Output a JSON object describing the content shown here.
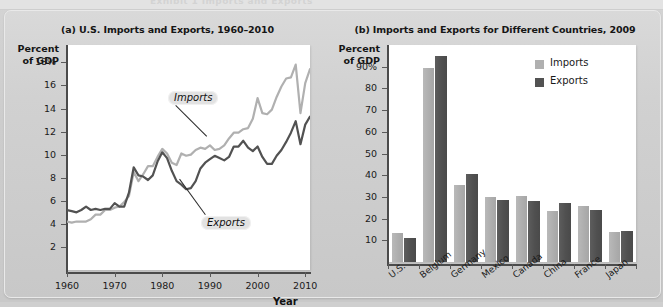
{
  "figure": {
    "top_strip_ghost_text": "Exhibit 1 Imports and Exports"
  },
  "panel_a": {
    "title": "(a) U.S. Imports and Exports, 1960–2010",
    "y_axis_title_line1": "Percent",
    "y_axis_title_line2": "of GDP",
    "x_axis_title": "Year",
    "callout_imports": "Imports",
    "callout_exports": "Exports"
  },
  "panel_b": {
    "title": "(b) Imports and Exports for Different Countries, 2009",
    "y_axis_title_line1": "Percent",
    "y_axis_title_line2": "of GDP",
    "legend": [
      {
        "label": "Imports",
        "color": "#b0b0b0"
      },
      {
        "label": "Exports",
        "color": "#525252"
      }
    ]
  },
  "colors": {
    "imports": "#b0b0b0",
    "exports": "#525252",
    "page_background": "#cfcfcf",
    "card_background": "#d4d4d4",
    "plot_background": "#ffffff",
    "axis": "#4b4b4b"
  },
  "chart_data": [
    {
      "type": "line",
      "panel": "a",
      "title": "(a) U.S. Imports and Exports, 1960–2010",
      "xlabel": "Year",
      "ylabel": "Percent of GDP",
      "xlim": [
        1960,
        2011
      ],
      "ylim": [
        0,
        19.5
      ],
      "xticks": [
        1960,
        1970,
        1980,
        1990,
        2000,
        2010
      ],
      "xticklabels": [
        "1960",
        "1970",
        "1980",
        "1990",
        "2000",
        "2010"
      ],
      "yticks": [
        2,
        4,
        6,
        8,
        10,
        12,
        14,
        16,
        18
      ],
      "yticklabels": [
        "2",
        "4",
        "6",
        "8",
        "10",
        "12",
        "14",
        "16",
        "18%"
      ],
      "grid": false,
      "legend_position": "inline-callouts",
      "annotations": [
        {
          "text": "Imports",
          "points_to_year": 1990
        },
        {
          "text": "Exports",
          "points_to_year": 1988
        }
      ],
      "x": [
        1960,
        1961,
        1962,
        1963,
        1964,
        1965,
        1966,
        1967,
        1968,
        1969,
        1970,
        1971,
        1972,
        1973,
        1974,
        1975,
        1976,
        1977,
        1978,
        1979,
        1980,
        1981,
        1982,
        1983,
        1984,
        1985,
        1986,
        1987,
        1988,
        1989,
        1990,
        1991,
        1992,
        1993,
        1994,
        1995,
        1996,
        1997,
        1998,
        1999,
        2000,
        2001,
        2002,
        2003,
        2004,
        2005,
        2006,
        2007,
        2008,
        2009,
        2010,
        2011
      ],
      "series": [
        {
          "name": "Imports",
          "color": "#b0b0b0",
          "values": [
            4.2,
            4.1,
            4.2,
            4.2,
            4.2,
            4.4,
            4.8,
            4.8,
            5.2,
            5.2,
            5.4,
            5.5,
            5.9,
            6.4,
            8.5,
            7.7,
            8.3,
            9.0,
            9.0,
            9.8,
            10.5,
            10.1,
            9.3,
            9.1,
            10.1,
            9.9,
            10.0,
            10.4,
            10.6,
            10.5,
            10.8,
            10.4,
            10.5,
            10.8,
            11.4,
            11.9,
            11.9,
            12.2,
            12.3,
            13.1,
            14.9,
            13.6,
            13.5,
            13.9,
            15.0,
            15.9,
            16.6,
            16.7,
            17.8,
            13.6,
            16.2,
            17.4
          ]
        },
        {
          "name": "Exports",
          "color": "#525252",
          "values": [
            5.2,
            5.1,
            5.0,
            5.2,
            5.5,
            5.2,
            5.3,
            5.2,
            5.3,
            5.3,
            5.8,
            5.5,
            5.5,
            6.7,
            8.9,
            8.2,
            8.1,
            7.8,
            8.2,
            9.4,
            10.2,
            9.7,
            8.6,
            7.7,
            7.4,
            7.0,
            7.1,
            7.7,
            8.8,
            9.3,
            9.6,
            9.9,
            9.7,
            9.5,
            9.8,
            10.7,
            10.7,
            11.2,
            10.6,
            10.3,
            10.7,
            9.8,
            9.2,
            9.2,
            9.9,
            10.4,
            11.1,
            11.9,
            12.9,
            10.9,
            12.6,
            13.3
          ]
        }
      ]
    },
    {
      "type": "bar",
      "panel": "b",
      "title": "(b) Imports and Exports for Different Countries, 2009",
      "xlabel": "",
      "ylabel": "Percent of GDP",
      "ylim": [
        0,
        100
      ],
      "yticks": [
        10,
        20,
        30,
        40,
        50,
        60,
        70,
        80,
        90
      ],
      "yticklabels": [
        "10",
        "20",
        "30",
        "40",
        "50",
        "60",
        "70",
        "80",
        "90%"
      ],
      "grid": false,
      "legend_position": "top-right",
      "categories": [
        "U.S.",
        "Belgium",
        "Germany",
        "Mexico",
        "Canada",
        "China",
        "France",
        "Japan"
      ],
      "series": [
        {
          "name": "Imports",
          "color": "#b0b0b0",
          "values": [
            13.5,
            89.5,
            35.5,
            30.0,
            30.5,
            23.5,
            26.0,
            14.0
          ]
        },
        {
          "name": "Exports",
          "color": "#525252",
          "values": [
            11.0,
            95.0,
            40.5,
            28.5,
            28.0,
            27.0,
            24.0,
            14.2
          ]
        }
      ]
    }
  ]
}
